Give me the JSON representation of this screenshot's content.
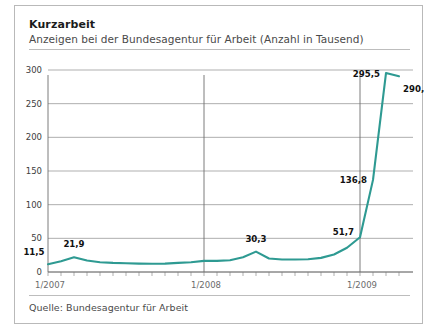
{
  "header": {
    "title": "Kurzarbeit",
    "subtitle": "Anzeigen bei der Bundesagentur für Arbeit (Anzahl in Tausend)"
  },
  "footer": {
    "source": "Quelle: Bundesagentur für Arbeit"
  },
  "colors": {
    "series": "#2e9a92",
    "grid": "#8d8d8d",
    "axis": "#6e6e6e",
    "border": "#b9b9b9",
    "title_text": "#1b1b1b",
    "subtitle_text": "#4a4a4a"
  },
  "chart_data": {
    "type": "line",
    "title": "Kurzarbeit",
    "subtitle": "Anzeigen bei der Bundesagentur für Arbeit (Anzahl in Tausend)",
    "xlabel": "",
    "ylabel": "Anzahl in Tausend",
    "ylim": [
      0,
      300
    ],
    "yticks": [
      0,
      50,
      100,
      150,
      200,
      250,
      300
    ],
    "ytick_labels": [
      "0",
      "50",
      "100",
      "150",
      "200",
      "250",
      "300"
    ],
    "xtick_positions": [
      0,
      12,
      24
    ],
    "xtick_labels": [
      "1/2007",
      "1/2008",
      "1/2009"
    ],
    "x_minor_ticks_per_unit": 1,
    "grid": true,
    "legend": null,
    "series_name": "Anzeigen Kurzarbeit",
    "x": [
      0,
      1,
      2,
      3,
      4,
      5,
      6,
      7,
      8,
      9,
      10,
      11,
      12,
      13,
      14,
      15,
      16,
      17,
      18,
      19,
      20,
      21,
      22,
      23,
      24,
      25,
      26
    ],
    "x_month_labels": [
      "1/2007",
      "2/2007",
      "3/2007",
      "4/2007",
      "5/2007",
      "6/2007",
      "7/2007",
      "8/2007",
      "9/2007",
      "10/2007",
      "11/2007",
      "12/2007",
      "1/2008",
      "2/2008",
      "3/2008",
      "4/2008",
      "5/2008",
      "6/2008",
      "7/2008",
      "8/2008",
      "9/2008",
      "10/2008",
      "11/2008",
      "12/2008",
      "1/2009",
      "2/2009",
      "3/2009"
    ],
    "values": [
      11.5,
      16.0,
      21.9,
      17.0,
      14.5,
      13.5,
      13.0,
      12.5,
      12.2,
      12.5,
      13.5,
      14.5,
      16.5,
      16.5,
      17.5,
      22.0,
      30.3,
      20.0,
      18.5,
      18.5,
      19.0,
      21.0,
      26.0,
      36.0,
      51.7,
      136.8,
      295.5
    ],
    "last_point_value": 290.6,
    "annotations": [
      {
        "label": "11,5",
        "value": 11.5,
        "x_index": 0
      },
      {
        "label": "21,9",
        "value": 21.9,
        "x_index": 2
      },
      {
        "label": "30,3",
        "value": 30.3,
        "x_index": 16
      },
      {
        "label": "51,7",
        "value": 51.7,
        "x_index": 24
      },
      {
        "label": "136,8",
        "value": 136.8,
        "x_index": 25
      },
      {
        "label": "295,5",
        "value": 295.5,
        "x_index": 26
      },
      {
        "label": "290,6",
        "value": 290.6,
        "x_index": 27
      }
    ]
  }
}
